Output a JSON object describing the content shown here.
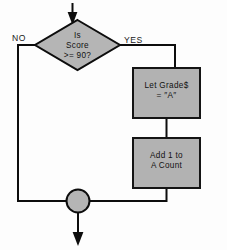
{
  "diagram": {
    "type": "flowchart",
    "background_color": "#fdfdfd",
    "shape_fill_color": "#b5b5b5",
    "outline_color": "#0d0d0d",
    "text_color": "#111111"
  },
  "decision": {
    "name": "score-decision",
    "shape": "diamond",
    "line1": "Is",
    "line2": "Score",
    "line3": ">=  90?"
  },
  "branches": {
    "no_label": "NO",
    "yes_label": "YES"
  },
  "process_boxes": [
    {
      "name": "let-grade-box",
      "shape": "rectangle",
      "line1": "Let Grade$",
      "line2": "=  ″A″"
    },
    {
      "name": "add-count-box",
      "shape": "rectangle",
      "line1": "Add 1 to",
      "line2": "A Count"
    }
  ],
  "connector": {
    "name": "merge-connector",
    "shape": "circle",
    "label": ""
  },
  "arrows": {
    "entry": "arrow-down-into-decision",
    "exit": "arrow-down-from-connector"
  }
}
